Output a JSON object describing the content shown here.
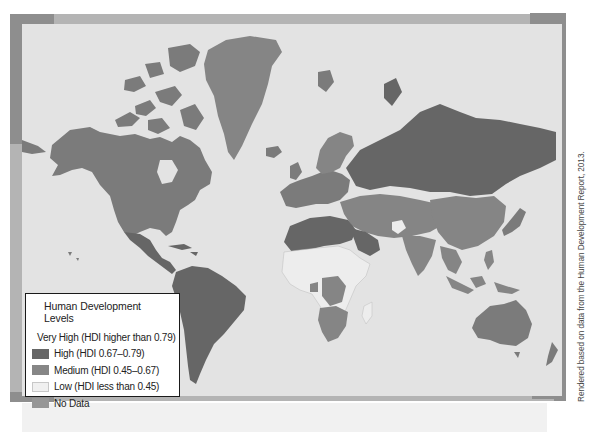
{
  "map": {
    "type": "choropleth world map",
    "subject": "Human Development Index by country",
    "colors": {
      "ocean": "#e3e3e3",
      "frame": "#b4b4b4",
      "frame_corner": "#8e8e8e",
      "very_high": "#7b7b7b",
      "high": "#666666",
      "medium": "#858585",
      "low": "#ededed",
      "no_data": "#959595"
    }
  },
  "legend": {
    "title": "Human Development Levels",
    "items": [
      {
        "label": "Very High (HDI higher than 0.79)",
        "color": "#7d7d7d"
      },
      {
        "label": "High (HDI 0.67–0.79)",
        "color": "#666666"
      },
      {
        "label": "Medium (HDI 0.45–0.67)",
        "color": "#868686"
      },
      {
        "label": "Low (HDI less than 0.45)",
        "color": "#f0f0f0"
      },
      {
        "label": "No Data",
        "color": "#969696"
      }
    ]
  },
  "credit": "Rendered based on data from the Human Development Report, 2013."
}
